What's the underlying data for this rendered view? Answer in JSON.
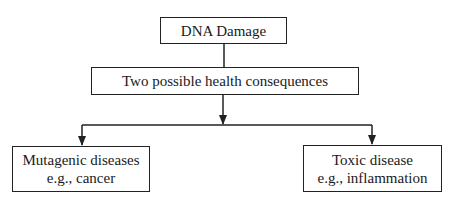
{
  "diagram": {
    "type": "flowchart",
    "nodes": [
      {
        "id": "dna",
        "lines": [
          "DNA Damage"
        ]
      },
      {
        "id": "two",
        "lines": [
          "Two possible health consequences"
        ]
      },
      {
        "id": "mut",
        "lines": [
          "Mutagenic diseases",
          "e.g., cancer"
        ]
      },
      {
        "id": "tox",
        "lines": [
          "Toxic disease",
          "e.g., inflammation"
        ]
      }
    ],
    "edges": [
      {
        "from": "dna",
        "to": "two",
        "arrow": false
      },
      {
        "from": "two",
        "to": "split",
        "arrow": true
      },
      {
        "from": "split",
        "to": "mut",
        "arrow": true
      },
      {
        "from": "split",
        "to": "tox",
        "arrow": true
      }
    ],
    "line_color": "#222222"
  }
}
